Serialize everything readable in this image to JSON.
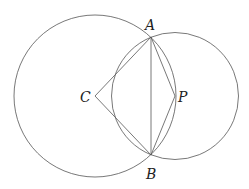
{
  "diagram": {
    "title": "",
    "points": [
      {
        "id": "A",
        "label": "A"
      },
      {
        "id": "B",
        "label": "B"
      },
      {
        "id": "C",
        "label": "C"
      },
      {
        "id": "P",
        "label": "P"
      }
    ],
    "circles": [
      {
        "id": "circle-C",
        "center": "C",
        "through": "A"
      },
      {
        "id": "circle-P",
        "center": "P",
        "through": "A"
      }
    ],
    "segments": [
      [
        "C",
        "A"
      ],
      [
        "C",
        "B"
      ],
      [
        "A",
        "B"
      ],
      [
        "A",
        "P"
      ],
      [
        "B",
        "P"
      ]
    ],
    "colors": {
      "line": "#555555",
      "text": "#222222",
      "background": "#ffffff"
    }
  }
}
